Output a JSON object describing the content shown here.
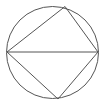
{
  "diagram": {
    "type": "geometry",
    "stroke_color": "#555555",
    "background": "#ffffff",
    "circle": {
      "cx": 52.5,
      "cy": 52.5,
      "r": 46
    },
    "points": [
      {
        "id": "A",
        "x": 7,
        "y": 52
      },
      {
        "id": "B",
        "x": 65,
        "y": 6.5
      },
      {
        "id": "C",
        "x": 98,
        "y": 52
      },
      {
        "id": "D",
        "x": 58,
        "y": 99
      }
    ],
    "segments": [
      [
        "A",
        "B"
      ],
      [
        "B",
        "C"
      ],
      [
        "C",
        "D"
      ],
      [
        "D",
        "A"
      ],
      [
        "A",
        "C"
      ]
    ]
  }
}
